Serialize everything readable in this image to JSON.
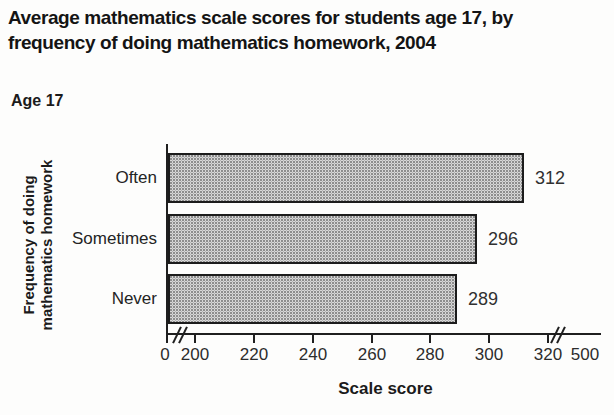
{
  "header": {
    "title": "Average mathematics scale scores for students age 17, by frequency of doing mathematics homework, 2004",
    "title_lines": [
      "Average mathematics scale scores for students age 17, by",
      "frequency of doing mathematics homework, 2004"
    ],
    "age_label": "Age 17"
  },
  "chart_data": {
    "type": "bar",
    "orientation": "horizontal",
    "title": "Average mathematics scale scores for students age 17, by frequency of doing mathematics homework, 2004",
    "subtitle": "Age 17",
    "categories": [
      "Often",
      "Sometimes",
      "Never"
    ],
    "values": [
      312,
      296,
      289
    ],
    "value_labels": [
      "312",
      "296",
      "289"
    ],
    "xlabel": "Scale score",
    "ylabel": "Frequency of doing mathematics homework",
    "ylabel_lines": [
      "Frequency of doing",
      "mathematics homework"
    ],
    "x_tick_labels": [
      "0",
      "200",
      "220",
      "240",
      "260",
      "280",
      "300",
      "320",
      "500"
    ],
    "x_tick_values": [
      0,
      200,
      220,
      240,
      260,
      280,
      300,
      320,
      500
    ],
    "xlim": [
      200,
      320
    ],
    "axis_breaks": [
      "0-200",
      "320-500"
    ],
    "grid": false,
    "legend": null,
    "bar_fill": "#d7d7d7",
    "bar_pattern": "stipple",
    "bar_border": "#1c1c1c",
    "axis_color": "#1f1f1f"
  },
  "colors": {
    "background": "#fdfdfc",
    "text": "#1a1a1a"
  }
}
